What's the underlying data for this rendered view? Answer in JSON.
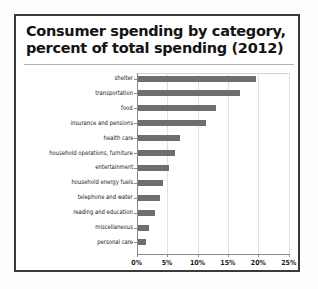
{
  "card": {
    "title_line1": "Consumer spending by category,",
    "title_line2": "percent of total spending (2012)"
  },
  "chart_data": {
    "type": "bar",
    "orientation": "horizontal",
    "title": "Consumer spending by category, percent of total spending (2012)",
    "xlabel": "",
    "ylabel": "",
    "xlim": [
      0,
      25
    ],
    "xticks": [
      "0%",
      "5%",
      "10%",
      "15%",
      "20%",
      "25%"
    ],
    "xtick_values": [
      0,
      5,
      10,
      15,
      20,
      25
    ],
    "grid": true,
    "legend": false,
    "bar_color": "#6e6e6e",
    "categories": [
      "shelter",
      "transportation",
      "food",
      "insurance and pensions",
      "health care",
      "household operations, furniture",
      "entertainment",
      "household energy fuels",
      "telephone and water",
      "reading and education",
      "miscellaneous",
      "personal care"
    ],
    "values": [
      19.4,
      16.8,
      12.9,
      11.2,
      7.0,
      6.2,
      5.1,
      4.1,
      3.6,
      2.8,
      1.9,
      1.4
    ]
  }
}
